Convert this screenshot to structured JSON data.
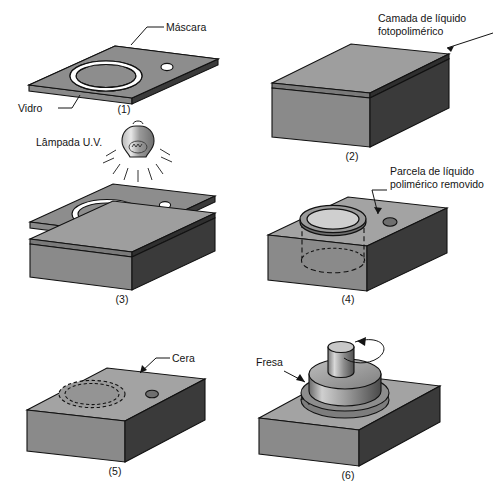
{
  "figure": {
    "language": "pt-BR",
    "background_color": "#ffffff",
    "line_color": "#111111",
    "palette": {
      "top_face": "#a8a8a8",
      "top_face_dark": "#8f8f8f",
      "front_face": "#8a8a8a",
      "right_face": "#3a3a3a",
      "mask_top": "#8d8d8d",
      "mask_edge": "#b4b4b4",
      "liquid_layer": "#6f6f6f",
      "wax": "#949494",
      "cutter_light": "#d4d4d4",
      "cutter_dark": "#5a5a5a",
      "white": "#ffffff"
    }
  },
  "panels": [
    {
      "id": "panel-1",
      "number": "(1)",
      "labels": [
        {
          "name": "mascara",
          "text": "Máscara"
        },
        {
          "name": "vidro",
          "text": "Vidro"
        }
      ]
    },
    {
      "id": "panel-2",
      "number": "(2)",
      "labels": [
        {
          "name": "camada-liquido",
          "text": "Camada de líquido"
        },
        {
          "name": "camada-liquido-2",
          "text": "fotopolimérico"
        }
      ]
    },
    {
      "id": "panel-3",
      "number": "(3)",
      "labels": [
        {
          "name": "lampada-uv",
          "text": "Lâmpada U.V."
        }
      ]
    },
    {
      "id": "panel-4",
      "number": "(4)",
      "labels": [
        {
          "name": "parcela-liquido",
          "text": "Parcela de líquido"
        },
        {
          "name": "parcela-liquido-2",
          "text": "polimérico removido"
        }
      ]
    },
    {
      "id": "panel-5",
      "number": "(5)",
      "labels": [
        {
          "name": "cera",
          "text": "Cera"
        }
      ]
    },
    {
      "id": "panel-6",
      "number": "(6)",
      "labels": [
        {
          "name": "fresa",
          "text": "Fresa"
        }
      ]
    }
  ]
}
